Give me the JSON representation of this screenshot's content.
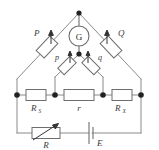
{
  "figure": {
    "name": "kelvin-double-bridge-circuit",
    "background_color": "#ffffff",
    "wire_color": "#8a8a8a",
    "node_color": "#222222",
    "label_color": "#3a3a3a",
    "width": 159,
    "height": 150
  },
  "components": {
    "galvanometer": {
      "label": "G",
      "type": "galvanometer"
    },
    "ratio_arm_left": {
      "label": "P",
      "type": "adjustable-resistor"
    },
    "ratio_arm_right": {
      "label": "Q",
      "type": "adjustable-resistor"
    },
    "inner_arm_left": {
      "label": "p",
      "type": "adjustable-resistor"
    },
    "inner_arm_right": {
      "label": "q",
      "type": "adjustable-resistor"
    },
    "standard_resistor": {
      "label": "R",
      "subscript": "S",
      "type": "resistor"
    },
    "link_resistor": {
      "label": "r",
      "type": "resistor"
    },
    "unknown_resistor": {
      "label": "R",
      "subscript": "X",
      "type": "resistor"
    },
    "rheostat": {
      "label": "R",
      "type": "rheostat"
    },
    "battery": {
      "label": "E",
      "type": "battery-cell"
    }
  }
}
